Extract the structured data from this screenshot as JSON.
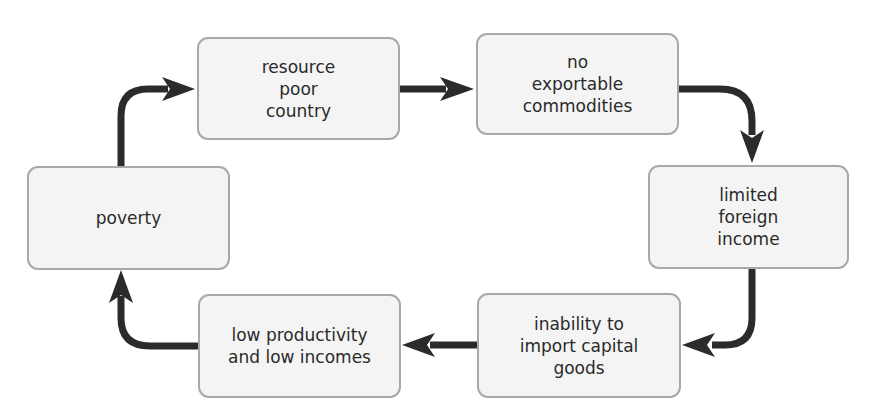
{
  "diagram": {
    "type": "cycle",
    "arrow_color": "#2b2b2b",
    "box_fill": "#f4f4f4",
    "box_border": "#a8a8a8",
    "nodes": [
      {
        "id": "resource-poor-country",
        "lines": [
          "resource",
          "poor",
          "country"
        ]
      },
      {
        "id": "no-exportable-commodities",
        "lines": [
          "no",
          "exportable",
          "commodities"
        ]
      },
      {
        "id": "limited-foreign-income",
        "lines": [
          "limited",
          "foreign",
          "income"
        ]
      },
      {
        "id": "inability-to-import-capital-goods",
        "lines": [
          "inability to",
          "import capital",
          "goods"
        ]
      },
      {
        "id": "low-productivity-and-low-incomes",
        "lines": [
          "low productivity",
          "and low incomes"
        ]
      },
      {
        "id": "poverty",
        "lines": [
          "poverty"
        ]
      }
    ],
    "edges": [
      {
        "from": "resource-poor-country",
        "to": "no-exportable-commodities"
      },
      {
        "from": "no-exportable-commodities",
        "to": "limited-foreign-income"
      },
      {
        "from": "limited-foreign-income",
        "to": "inability-to-import-capital-goods"
      },
      {
        "from": "inability-to-import-capital-goods",
        "to": "low-productivity-and-low-incomes"
      },
      {
        "from": "low-productivity-and-low-incomes",
        "to": "poverty"
      },
      {
        "from": "poverty",
        "to": "resource-poor-country"
      }
    ]
  }
}
